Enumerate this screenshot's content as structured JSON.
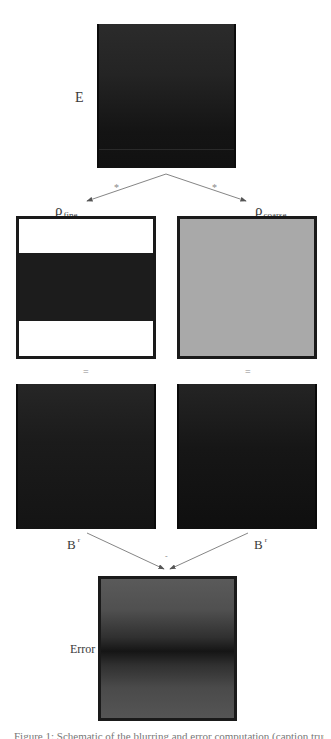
{
  "diagram": {
    "input": {
      "label": "E"
    },
    "operators": {
      "convolve_left": "*",
      "convolve_right": "*",
      "equals_left": "=",
      "equals_right": "=",
      "subtract": "-"
    },
    "kernels": {
      "fine": {
        "symbol": "ρ",
        "subscript": "fine"
      },
      "coarse": {
        "symbol": "ρ",
        "subscript": "coarse"
      }
    },
    "results": {
      "left": {
        "symbol": "B",
        "superscript": "r"
      },
      "right": {
        "symbol": "B",
        "superscript": "r"
      }
    },
    "output": {
      "label": "Error"
    },
    "colors": {
      "e_panel": "#1e1e1e",
      "fine_band": "#1c1c1c",
      "fine_background": "#ffffff",
      "coarse_fill": "#a9a9a9",
      "result_panels": "#161616",
      "error_panel": "#505050",
      "arrows": "#555555"
    }
  },
  "caption": {
    "text": "Figure 1: Schematic of the blurring and error computation (caption truncated)"
  }
}
